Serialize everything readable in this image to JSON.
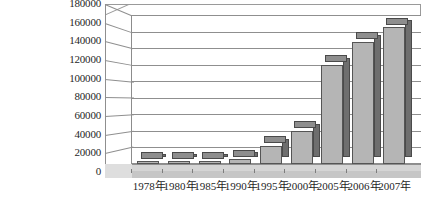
{
  "chart_data": {
    "type": "bar",
    "title": "",
    "subtitle": "",
    "xlabel": "",
    "ylabel": "",
    "categories": [
      "1978年",
      "1980年",
      "1985年",
      "1990年",
      "1995年",
      "2000年",
      "2005年",
      "2006年",
      "2007年"
    ],
    "values": [
      1000,
      2000,
      3000,
      6000,
      22000,
      40000,
      120000,
      148000,
      165000
    ],
    "series": [
      {
        "name": "",
        "values": [
          1000,
          2000,
          3000,
          6000,
          22000,
          40000,
          120000,
          148000,
          165000
        ]
      }
    ],
    "ylim": [
      0,
      180000
    ],
    "ytick_values": [
      0,
      20000,
      40000,
      60000,
      80000,
      100000,
      120000,
      140000,
      160000,
      180000
    ],
    "ytick_labels": [
      "0",
      "20000",
      "40000",
      "60000",
      "80000",
      "100000",
      "120000",
      "140000",
      "160000",
      "180000"
    ],
    "grid": true,
    "legend": false,
    "legend_position": "none",
    "style": "3d-column",
    "colors": {
      "bar_front": "#b5b5b5",
      "bar_side": "#6e6e6e",
      "bar_top": "#8e8e8e",
      "bar_outline": "#555555",
      "gridline": "#8f8f8f",
      "axis": "#8f8f8f",
      "floor": "#d5d5d5",
      "background": "#ffffff",
      "text": "#1f1f1f"
    }
  }
}
